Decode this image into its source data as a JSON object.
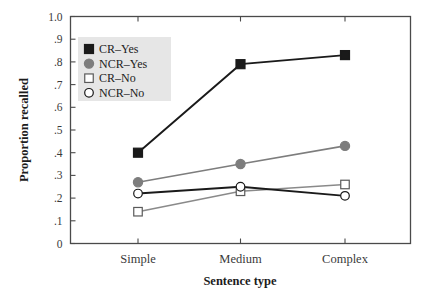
{
  "chart_data": {
    "type": "line",
    "title": "",
    "xlabel": "Sentence type",
    "ylabel": "Proportion recalled",
    "categories": [
      "Simple",
      "Medium",
      "Complex"
    ],
    "ylim": [
      0,
      1.0
    ],
    "ytick_labels": [
      "0",
      ".1",
      ".2",
      ".3",
      ".4",
      ".5",
      ".6",
      ".7",
      ".8",
      ".9",
      "1.0"
    ],
    "ytick_values": [
      0,
      0.1,
      0.2,
      0.3,
      0.4,
      0.5,
      0.6,
      0.7,
      0.8,
      0.9,
      1.0
    ],
    "grid": false,
    "legend_position": "upper-left-inside",
    "series": [
      {
        "name": "CR–Yes",
        "values": [
          0.4,
          0.79,
          0.83
        ],
        "marker": "filled-square",
        "marker_color": "#1a1a1a",
        "line_color": "#1a1a1a"
      },
      {
        "name": "NCR–Yes",
        "values": [
          0.27,
          0.35,
          0.43
        ],
        "marker": "filled-circle",
        "marker_color": "#7d7d7d",
        "line_color": "#7d7d7d"
      },
      {
        "name": "CR–No",
        "values": [
          0.14,
          0.23,
          0.26
        ],
        "marker": "open-square",
        "marker_color": "#ffffff",
        "line_color": "#8a8a8a"
      },
      {
        "name": "NCR–No",
        "values": [
          0.22,
          0.25,
          0.21
        ],
        "marker": "open-circle",
        "marker_color": "#ffffff",
        "line_color": "#1a1a1a"
      }
    ]
  },
  "legend": {
    "background": "#e6e6e6",
    "entries": [
      {
        "label": "CR–Yes"
      },
      {
        "label": "NCR–Yes"
      },
      {
        "label": "CR–No"
      },
      {
        "label": "NCR–No"
      }
    ]
  },
  "axes": {
    "x_title": "Sentence type",
    "y_title": "Proportion recalled"
  }
}
